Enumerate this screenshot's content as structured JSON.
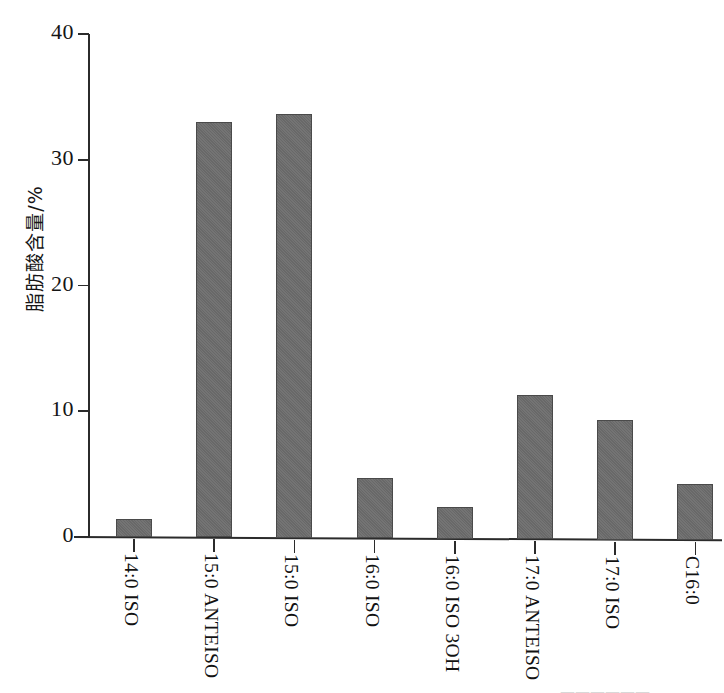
{
  "chart_data": {
    "type": "bar",
    "title": "",
    "xlabel": "",
    "ylabel": "脂肪酸含量/%",
    "ylim": [
      0,
      40
    ],
    "ytick_labels": [
      "0",
      "10",
      "20",
      "30",
      "40"
    ],
    "ytick_values": [
      0,
      10,
      20,
      30,
      40
    ],
    "grid": false,
    "legend": null,
    "bar_color": "#6e6e6e",
    "axis_color": "#2b2b2b",
    "categories": [
      "14:0 ISO",
      "15:0 ANTEISO",
      "15:0 ISO",
      "16:0 ISO",
      "16:0 ISO 3OH",
      "17:0 ANTEISO",
      "17:0 ISO",
      "C16:0"
    ],
    "values": [
      1.4,
      33.0,
      33.7,
      4.8,
      2.5,
      11.5,
      9.5,
      4.5
    ]
  },
  "artifacts": {
    "bottom_cropped_text": "——————"
  }
}
